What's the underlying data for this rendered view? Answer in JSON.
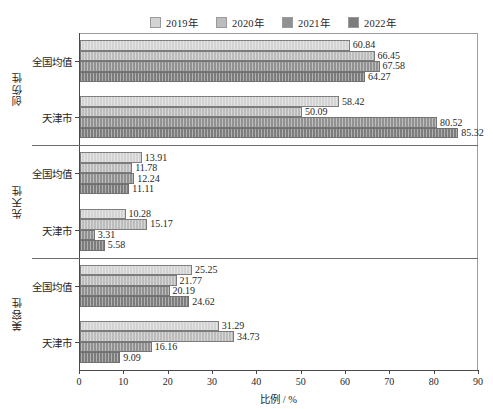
{
  "chart_data": {
    "type": "bar",
    "orientation": "horizontal",
    "title": "",
    "xlabel": "比例 / %",
    "ylabel": "",
    "xlim": [
      0,
      90
    ],
    "xticks": [
      0,
      10,
      20,
      30,
      40,
      50,
      60,
      70,
      80,
      90
    ],
    "grid": false,
    "legend_position": "top",
    "series": [
      {
        "name": "2019年",
        "color": "#d3d3d3"
      },
      {
        "name": "2020年",
        "color": "#bcbcbc"
      },
      {
        "name": "2021年",
        "color": "#919191"
      },
      {
        "name": "2022年",
        "color": "#7c7c7c"
      }
    ],
    "sections": [
      {
        "label": "创伤性",
        "groups": [
          {
            "label": "全国均值",
            "values": [
              60.84,
              66.45,
              67.58,
              64.27
            ]
          },
          {
            "label": "天津市",
            "values": [
              58.42,
              50.09,
              80.52,
              85.32
            ]
          }
        ]
      },
      {
        "label": "先天性",
        "groups": [
          {
            "label": "全国均值",
            "values": [
              13.91,
              11.78,
              12.24,
              11.11
            ]
          },
          {
            "label": "天津市",
            "values": [
              10.28,
              15.17,
              3.31,
              5.58
            ]
          }
        ]
      },
      {
        "label": "美容性",
        "groups": [
          {
            "label": "全国均值",
            "values": [
              25.25,
              21.77,
              20.19,
              24.62
            ]
          },
          {
            "label": "天津市",
            "values": [
              31.29,
              34.73,
              16.16,
              9.09
            ]
          }
        ]
      }
    ]
  }
}
